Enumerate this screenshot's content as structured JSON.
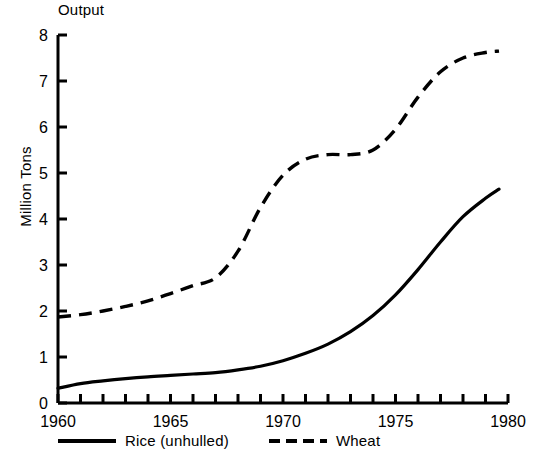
{
  "chart_data": {
    "type": "line",
    "title": "Output",
    "xlabel": "",
    "ylabel": "Million Tons",
    "xlim": [
      1960,
      1980
    ],
    "ylim": [
      0,
      8
    ],
    "ytick_labels": [
      "0",
      "1",
      "2",
      "3",
      "4",
      "5",
      "6",
      "7",
      "8"
    ],
    "ytick_values": [
      0,
      1,
      2,
      3,
      4,
      5,
      6,
      7,
      8
    ],
    "xtick_labels": [
      "1960",
      "1965",
      "1970",
      "1975",
      "1980"
    ],
    "xtick_values": [
      1960,
      1965,
      1970,
      1975,
      1980
    ],
    "x_minor_tick_interval": 1,
    "grid": false,
    "legend_position": "bottom",
    "x": [
      1960,
      1961,
      1962,
      1963,
      1964,
      1965,
      1966,
      1967,
      1968,
      1969,
      1970,
      1971,
      1972,
      1973,
      1974,
      1975,
      1976,
      1977,
      1978,
      1979
    ],
    "series": [
      {
        "name": "Rice (unhulled)",
        "style": "solid",
        "color": "#000000",
        "values": [
          0.32,
          0.42,
          0.48,
          0.53,
          0.57,
          0.6,
          0.63,
          0.66,
          0.72,
          0.8,
          0.92,
          1.08,
          1.28,
          1.55,
          1.9,
          2.35,
          2.9,
          3.5,
          4.05,
          4.45
        ]
      },
      {
        "name": "Wheat",
        "style": "dashed",
        "color": "#000000",
        "values": [
          1.87,
          1.92,
          2.0,
          2.1,
          2.22,
          2.38,
          2.55,
          2.72,
          3.3,
          4.25,
          4.95,
          5.3,
          5.4,
          5.4,
          5.5,
          5.95,
          6.65,
          7.2,
          7.5,
          7.62
        ]
      }
    ],
    "series_end_values": {
      "rice_final": 4.65,
      "wheat_final": 7.65
    }
  },
  "legend": {
    "items": [
      {
        "label": "Rice (unhulled)",
        "style": "solid"
      },
      {
        "label": "Wheat",
        "style": "dashed"
      }
    ]
  }
}
